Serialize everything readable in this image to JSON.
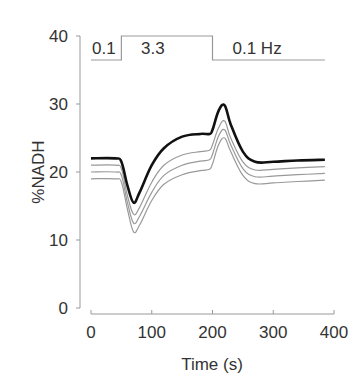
{
  "chart_data": {
    "type": "line",
    "title": "",
    "xlabel": "Time (s)",
    "ylabel": "%NADH",
    "xlim": [
      0,
      400
    ],
    "ylim": [
      0,
      40
    ],
    "xticks": [
      0,
      100,
      200,
      300,
      400
    ],
    "yticks": [
      0,
      10,
      20,
      30,
      40
    ],
    "grid": false,
    "legend": null,
    "stimulus_protocol": {
      "segments": [
        {
          "label": "0.1",
          "start": 0,
          "end": 50,
          "level": "low"
        },
        {
          "label": "3.3",
          "start": 50,
          "end": 200,
          "level": "high"
        },
        {
          "label": "0.1 Hz",
          "start": 200,
          "end": 385,
          "level": "low"
        }
      ]
    },
    "x": [
      0,
      40,
      50,
      60,
      70,
      80,
      100,
      120,
      150,
      180,
      195,
      200,
      210,
      220,
      230,
      250,
      270,
      300,
      340,
      385
    ],
    "series": [
      {
        "name": "trace-1 (bold)",
        "color": "#111111",
        "values": [
          22,
          22,
          21.5,
          18,
          15.5,
          17,
          21,
          23.5,
          25.2,
          25.6,
          25.6,
          26.2,
          29,
          29.8,
          27,
          23,
          21.5,
          21.5,
          21.7,
          21.8
        ]
      },
      {
        "name": "trace-2",
        "color": "#999999",
        "values": [
          21,
          21,
          20.5,
          16.5,
          13.8,
          14.8,
          18.5,
          21,
          22.5,
          23,
          23.2,
          24,
          26.5,
          27.5,
          25,
          21.5,
          20.3,
          20.4,
          20.6,
          20.8
        ]
      },
      {
        "name": "trace-3",
        "color": "#999999",
        "values": [
          20,
          20,
          19.5,
          15.5,
          12.5,
          13.5,
          17,
          19.5,
          21,
          21.6,
          21.8,
          22.6,
          25.3,
          26.2,
          24,
          20.5,
          19.3,
          19.4,
          19.6,
          19.8
        ]
      },
      {
        "name": "trace-4",
        "color": "#999999",
        "values": [
          19,
          19,
          18.5,
          14.5,
          11.2,
          12.2,
          15.8,
          18.2,
          19.6,
          20.2,
          20.4,
          21.2,
          24,
          25,
          23,
          19.5,
          18.3,
          18.4,
          18.6,
          18.8
        ]
      }
    ]
  }
}
